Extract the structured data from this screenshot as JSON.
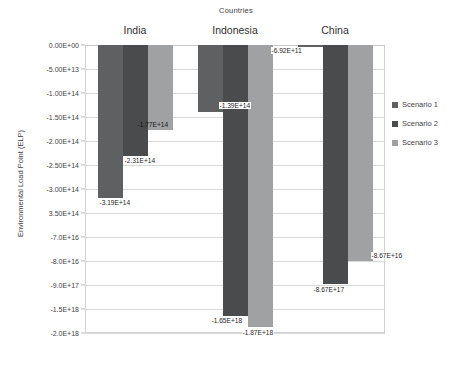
{
  "chart_data": {
    "type": "bar",
    "title": "Countries",
    "xlabel": "",
    "ylabel": "Environmental Load Point (ELP)",
    "orientation": "vertical",
    "grid": true,
    "legend_position": "right",
    "axis_note": "Y axis uses a broken / non-linear scale",
    "categories": [
      "India",
      "Indonesia",
      "China"
    ],
    "ytick_labels": [
      "0.00E+00",
      "-5.00E+13",
      "-1.00E+14",
      "-1.50E+14",
      "-2.00E+14",
      "-2.50E+14",
      "-3.00E+14",
      "3.50E+14",
      "-7.0E+16",
      "-8.0E+16",
      "-9.0E+17",
      "-1.5E+18",
      "-2.0E+18"
    ],
    "series": [
      {
        "name": "Scenario 1",
        "color": "#5f6062",
        "values": [
          -319000000000000.0,
          -139000000000000.0,
          -692000000000.0
        ],
        "labels": [
          "-3.19E+14",
          "-1.39E+14",
          "-6.92E+11"
        ]
      },
      {
        "name": "Scenario 2",
        "color": "#4a4b4d",
        "values": [
          -231000000000000.0,
          -1.65e+18,
          -8.67e+17
        ],
        "labels": [
          "-2.31E+14",
          "-1.65E+18",
          "-8.67E+17"
        ]
      },
      {
        "name": "Scenario 3",
        "color": "#a0a1a3",
        "values": [
          -177000000000000.0,
          -1.87e+18,
          -8.67e+16
        ],
        "labels": [
          "-1.77E+14",
          "-1.87E+18",
          "-8.67E+16"
        ]
      }
    ]
  },
  "legend": {
    "items": [
      {
        "label": "Scenario 1"
      },
      {
        "label": "Scenario 2"
      },
      {
        "label": "Scenario 3"
      }
    ]
  }
}
